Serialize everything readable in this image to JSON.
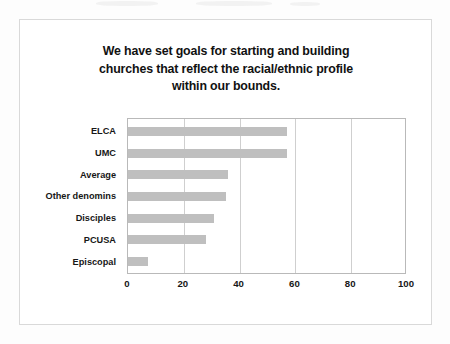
{
  "slide": {
    "title_line_1": "We have set goals for starting and building",
    "title_line_2": "churches that reflect the racial/ethnic profile",
    "title_line_3": "within our bounds."
  },
  "style": {
    "bar_color": "#bfbfbf",
    "plot_border_color": "#b9b9b9",
    "gridline_color": "#cfcfcf",
    "card_border_color": "#d9d9d9",
    "page_background": "#fdfdfd",
    "text_color": "#171717"
  },
  "chart_data": {
    "type": "bar",
    "orientation": "horizontal",
    "title": "We have set goals for starting and building churches that reflect the racial/ethnic profile within our bounds.",
    "xlabel": "",
    "ylabel": "",
    "categories": [
      "ELCA",
      "UMC",
      "Average",
      "Other denomins",
      "Disciples",
      "PCUSA",
      "Episcopal"
    ],
    "values": [
      57,
      57,
      36,
      35,
      31,
      28,
      7
    ],
    "xlim": [
      0,
      100
    ],
    "xticks": [
      0,
      20,
      40,
      60,
      80,
      100
    ],
    "gridlines": [
      20,
      40,
      60,
      80
    ],
    "grid": true,
    "legend": false,
    "series": [
      {
        "name": "Percent",
        "values": [
          57,
          57,
          36,
          35,
          31,
          28,
          7
        ]
      }
    ]
  }
}
